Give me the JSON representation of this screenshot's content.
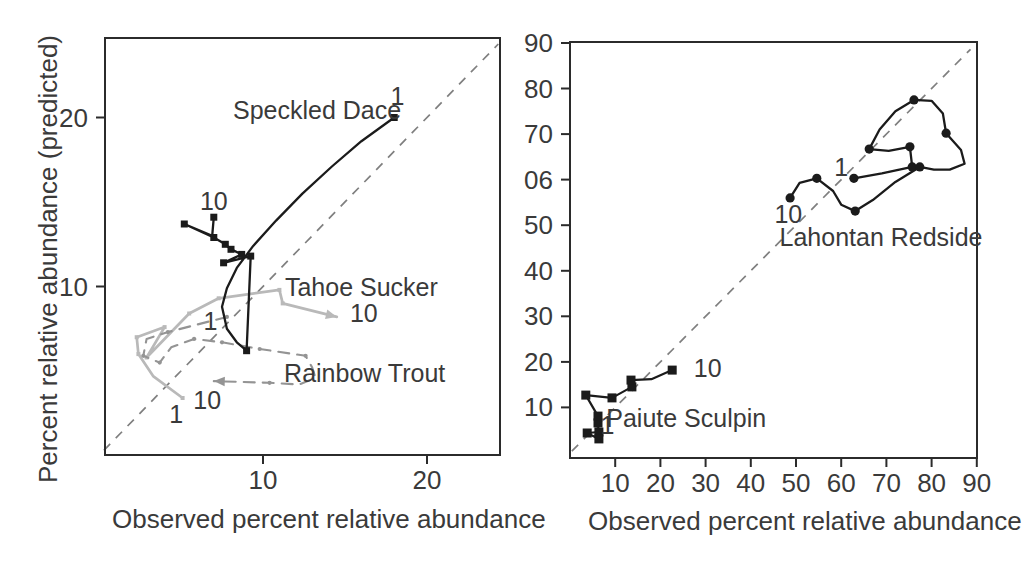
{
  "figure": {
    "left": {
      "ylabel": "Percent relative abundance (predicted)",
      "xlabel": "Observed percent relative abundance"
    },
    "right": {
      "xlabel": "Observed percent relative abundance"
    }
  },
  "colors": {
    "background": "#ffffff",
    "axis": "#2b2b2b",
    "text": "#3a3a3a",
    "diagonal": "#7f7f7f",
    "black_series": "#1b1b1b",
    "mid_gray_series": "#949494",
    "light_gray_series": "#b9b9b9"
  },
  "chart_data": [
    {
      "type": "line",
      "panel": "left",
      "title": "",
      "xlabel": "Observed percent relative abundance",
      "ylabel": "Percent relative abundance (predicted)",
      "xlim": [
        0,
        24.5
      ],
      "ylim": [
        0,
        24.7
      ],
      "grid": false,
      "xticks": [
        {
          "value": 10,
          "label": "10"
        },
        {
          "value": 20,
          "label": "20"
        }
      ],
      "yticks": [
        {
          "value": 10,
          "label": "10"
        },
        {
          "value": 20,
          "label": "20"
        }
      ],
      "identity_line": {
        "style": "dashed",
        "from": [
          0.3,
          0.3
        ],
        "to": [
          24.35,
          24.35
        ]
      },
      "series": [
        {
          "name": "Tahoe Sucker",
          "color": "#b9b9b9",
          "line_style": "solid",
          "width": 2.7,
          "marker": "square",
          "marker_size": 4,
          "end_arrow": true,
          "first_label": "1",
          "last_label": "10",
          "path": [
            [
              5.1,
              3.4,
              1
            ],
            [
              3.3,
              4.7,
              0
            ],
            [
              2.4,
              6.0,
              1
            ],
            [
              2.3,
              7.0,
              1
            ],
            [
              4.0,
              7.6,
              1
            ],
            [
              2.9,
              5.8,
              1
            ],
            [
              5.5,
              8.4,
              1
            ],
            [
              7.3,
              9.3,
              1
            ],
            [
              11.0,
              9.8,
              1
            ],
            [
              11.2,
              9.0,
              1
            ],
            [
              14.5,
              8.2,
              1
            ]
          ]
        },
        {
          "name": "Rainbow Trout",
          "color": "#949494",
          "line_style": "dashed",
          "width": 2.1,
          "marker": "dot",
          "marker_size": 4,
          "end_arrow": true,
          "first_label": "1",
          "last_label": "10",
          "path": [
            [
              7.8,
              8.2,
              1
            ],
            [
              4.2,
              7.3,
              1
            ],
            [
              2.9,
              6.9,
              0
            ],
            [
              2.7,
              5.9,
              1
            ],
            [
              3.7,
              5.5,
              1
            ],
            [
              4.4,
              6.4,
              0
            ],
            [
              5.8,
              6.9,
              1
            ],
            [
              7.5,
              6.7,
              1
            ],
            [
              9.8,
              6.3,
              1
            ],
            [
              12.6,
              5.9,
              1
            ],
            [
              13.0,
              5.2,
              0
            ],
            [
              13.2,
              4.6,
              0
            ],
            [
              12.2,
              4.2,
              0
            ],
            [
              10.4,
              4.3,
              1
            ],
            [
              7.0,
              4.4,
              1
            ]
          ]
        },
        {
          "name": "Speckled Dace",
          "color": "#1b1b1b",
          "line_style": "solid",
          "width": 2.3,
          "marker": "square",
          "marker_size": 7,
          "end_arrow": false,
          "first_label": "1",
          "last_label": "10",
          "path": [
            [
              18.0,
              20.0,
              1
            ],
            [
              16.0,
              18.6,
              0
            ],
            [
              14.2,
              17.1,
              0
            ],
            [
              12.4,
              15.5,
              0
            ],
            [
              10.8,
              13.9,
              0
            ],
            [
              9.4,
              12.4,
              0
            ],
            [
              8.4,
              11.1,
              0
            ],
            [
              7.8,
              9.9,
              0
            ],
            [
              7.5,
              8.8,
              0
            ],
            [
              7.8,
              7.5,
              0
            ],
            [
              8.4,
              6.7,
              0
            ],
            [
              9.0,
              6.2,
              1
            ],
            [
              9.25,
              11.8,
              1
            ],
            [
              7.6,
              11.4,
              1
            ],
            [
              8.7,
              11.9,
              1
            ],
            [
              8.05,
              12.2,
              1
            ],
            [
              7.7,
              12.5,
              1
            ],
            [
              7.0,
              12.9,
              1
            ],
            [
              5.2,
              13.7,
              1
            ],
            [
              6.9,
              13.0,
              0
            ],
            [
              7.0,
              14.1,
              1
            ]
          ]
        }
      ],
      "annotations": [
        {
          "text": "Speckled Dace",
          "x": 13.3,
          "y": 20.4,
          "anchor": "middle"
        },
        {
          "text": "1",
          "x": 18.2,
          "y": 21.2,
          "anchor": "middle"
        },
        {
          "text": "10",
          "x": 7.0,
          "y": 15.0,
          "anchor": "middle"
        },
        {
          "text": "Tahoe Sucker",
          "x": 16.0,
          "y": 9.9,
          "anchor": "middle"
        },
        {
          "text": "10",
          "x": 15.3,
          "y": 8.4,
          "anchor": "start"
        },
        {
          "text": "1",
          "x": 6.8,
          "y": 7.9,
          "anchor": "middle"
        },
        {
          "text": "Rainbow Trout",
          "x": 16.2,
          "y": 4.8,
          "anchor": "middle"
        },
        {
          "text": "10",
          "x": 6.6,
          "y": 3.2,
          "anchor": "middle"
        },
        {
          "text": "1",
          "x": 4.7,
          "y": 2.4,
          "anchor": "middle"
        }
      ]
    },
    {
      "type": "line",
      "panel": "right",
      "title": "",
      "xlabel": "Observed percent relative abundance",
      "ylabel": "",
      "xlim": [
        0,
        90
      ],
      "ylim": [
        0,
        90
      ],
      "grid": false,
      "xticks": [
        {
          "value": 10,
          "label": "10"
        },
        {
          "value": 20,
          "label": "20"
        },
        {
          "value": 30,
          "label": "30"
        },
        {
          "value": 40,
          "label": "40"
        },
        {
          "value": 50,
          "label": "50"
        },
        {
          "value": 60,
          "label": "60"
        },
        {
          "value": 70,
          "label": "70"
        },
        {
          "value": 80,
          "label": "80"
        },
        {
          "value": 90,
          "label": "90"
        }
      ],
      "yticks": [
        {
          "value": 10,
          "label": "10"
        },
        {
          "value": 20,
          "label": "20"
        },
        {
          "value": 30,
          "label": "30"
        },
        {
          "value": 40,
          "label": "40"
        },
        {
          "value": 50,
          "label": "50"
        },
        {
          "value": 60,
          "label": "06"
        },
        {
          "value": 70,
          "label": "70"
        },
        {
          "value": 80,
          "label": "80"
        },
        {
          "value": 90,
          "label": "90"
        }
      ],
      "identity_line": {
        "style": "dashed",
        "from": [
          0.4,
          0.4
        ],
        "to": [
          88.6,
          88.6
        ]
      },
      "series": [
        {
          "name": "Lahontan Redside",
          "color": "#1b1b1b",
          "line_style": "solid",
          "width": 2.3,
          "marker": "circle",
          "marker_size": 9.2,
          "end_arrow": false,
          "first_label": "1",
          "last_label": "10",
          "path": [
            [
              62.8,
              60.3,
              1
            ],
            [
              69.0,
              61.4,
              0
            ],
            [
              75.7,
              62.8,
              1
            ],
            [
              75.2,
              67.2,
              1
            ],
            [
              70.5,
              66.3,
              0
            ],
            [
              66.2,
              66.7,
              1
            ],
            [
              68.5,
              71.0,
              0
            ],
            [
              72.0,
              75.0,
              0
            ],
            [
              76.1,
              77.5,
              1
            ],
            [
              80.0,
              77.3,
              0
            ],
            [
              82.5,
              74.5,
              0
            ],
            [
              83.2,
              70.2,
              1
            ],
            [
              86.5,
              66.5,
              0
            ],
            [
              87.3,
              63.5,
              0
            ],
            [
              84.0,
              62.2,
              0
            ],
            [
              80.5,
              62.2,
              0
            ],
            [
              77.4,
              62.8,
              1
            ],
            [
              72.0,
              59.5,
              0
            ],
            [
              67.0,
              55.5,
              0
            ],
            [
              63.1,
              53.1,
              1
            ],
            [
              60.0,
              54.5,
              0
            ],
            [
              58.2,
              57.5,
              0
            ],
            [
              54.6,
              60.3,
              1
            ],
            [
              50.8,
              59.3,
              0
            ],
            [
              48.7,
              56.0,
              1
            ]
          ]
        },
        {
          "name": "Paiute Sculpin",
          "color": "#1b1b1b",
          "line_style": "solid",
          "width": 2.2,
          "marker": "square",
          "marker_size": 9,
          "end_arrow": false,
          "first_label": "1",
          "last_label": "10",
          "path": [
            [
              6.4,
              4.6,
              1
            ],
            [
              3.8,
              4.4,
              1
            ],
            [
              6.4,
              3.1,
              1
            ],
            [
              6.2,
              6.6,
              1
            ],
            [
              6.2,
              8.1,
              1
            ],
            [
              3.5,
              12.7,
              1
            ],
            [
              9.3,
              12.1,
              1
            ],
            [
              13.7,
              14.5,
              1
            ],
            [
              13.5,
              16.0,
              1
            ],
            [
              18.0,
              16.2,
              0
            ],
            [
              22.6,
              18.2,
              1
            ]
          ]
        }
      ],
      "annotations": [
        {
          "text": "1",
          "x": 60.0,
          "y": 62.6,
          "anchor": "middle"
        },
        {
          "text": "10",
          "x": 48.3,
          "y": 52.3,
          "anchor": "middle"
        },
        {
          "text": "Lahontan Redside",
          "x": 68.8,
          "y": 47.2,
          "anchor": "middle"
        },
        {
          "text": "Paiute Sculpin",
          "x": 25.7,
          "y": 7.5,
          "anchor": "middle"
        },
        {
          "text": "1",
          "x": 8.3,
          "y": 5.9,
          "anchor": "middle"
        },
        {
          "text": "10",
          "x": 27.4,
          "y": 18.4,
          "anchor": "start"
        }
      ]
    }
  ]
}
